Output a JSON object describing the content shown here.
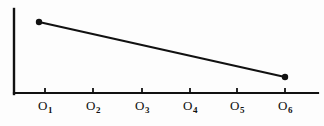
{
  "chart_data": {
    "type": "line",
    "title": "",
    "xlabel": "",
    "ylabel": "",
    "grid": false,
    "legend": false,
    "categories": [
      "O1",
      "O2",
      "O3",
      "O4",
      "O5",
      "O6"
    ],
    "tick_labels": [
      {
        "base": "O",
        "sub": "1"
      },
      {
        "base": "O",
        "sub": "2"
      },
      {
        "base": "O",
        "sub": "3"
      },
      {
        "base": "O",
        "sub": "4"
      },
      {
        "base": "O",
        "sub": "5"
      },
      {
        "base": "O",
        "sub": "6"
      }
    ],
    "series": [
      {
        "name": "trend",
        "points": [
          {
            "x": "O1",
            "y": 0.78
          },
          {
            "x": "O6",
            "y": 0.22
          }
        ],
        "marker": "dot",
        "color": "#111111"
      }
    ],
    "xlim": [
      0,
      7
    ],
    "ylim": [
      0,
      1
    ],
    "axis_color": "#111111",
    "background_color": "#fdfdfd"
  },
  "geometry": {
    "y_axis": {
      "x": 14,
      "y_top": 9,
      "y_bottom": 94
    },
    "x_axis": {
      "y": 93,
      "x_left": 14,
      "x_right": 318
    },
    "tick_x": [
      45,
      93,
      142,
      190,
      237,
      285
    ],
    "tick_top": 88,
    "tick_bottom": 93,
    "label_y": 99,
    "data_points": [
      {
        "cx": 39,
        "cy": 22,
        "r": 3.2
      },
      {
        "cx": 285,
        "cy": 77,
        "r": 3.2
      }
    ],
    "line": {
      "x1": 39,
      "y1": 22,
      "x2": 285,
      "y2": 77,
      "width": 2.2
    }
  }
}
